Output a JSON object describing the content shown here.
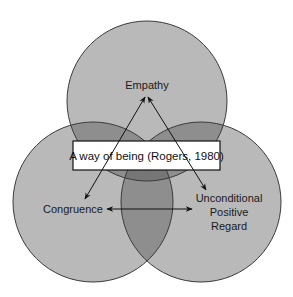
{
  "diagram": {
    "type": "venn",
    "circles": [
      {
        "id": "empathy",
        "label": "Empathy",
        "cx": 147,
        "cy": 101,
        "r": 80
      },
      {
        "id": "congruence",
        "label": "Congruence",
        "cx": 93,
        "cy": 202,
        "r": 80
      },
      {
        "id": "upr",
        "label_lines": [
          "Unconditional",
          "Positive",
          "Regard"
        ],
        "cx": 201,
        "cy": 202,
        "r": 80
      }
    ],
    "center_box": {
      "label": "A way of being (Rogers, 1980)"
    },
    "colors": {
      "single": "#b9b9b9",
      "double": "#8e8e8e",
      "triple": "#767676",
      "outline": "#3a3a3a",
      "box_fill": "#ffffff"
    },
    "arrows": [
      {
        "from": "empathy",
        "to": "congruence",
        "bidirectional": true
      },
      {
        "from": "empathy",
        "to": "upr",
        "bidirectional": true
      },
      {
        "from": "congruence",
        "to": "upr",
        "bidirectional": true
      }
    ]
  }
}
